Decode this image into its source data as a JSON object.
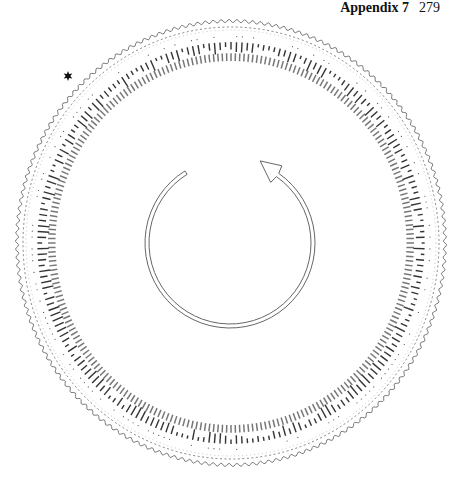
{
  "header": {
    "title": "Appendix 7",
    "page_number": "279"
  },
  "diagram": {
    "type": "circular-chronology-wheel",
    "marker": {
      "shape": "star",
      "angle_deg": 227
    },
    "outer_border": "wavy",
    "rings": [
      "wavy-outer-border",
      "dashed-ring",
      "name-labels-ring",
      "year-labels-ring"
    ],
    "visible_name_labels_left": [
      "Bu",
      "Chuan",
      "Ou",
      "Mohol",
      "Lamar",
      "Marrs",
      "Corn",
      "Chowmah",
      "Karr",
      "Abbel",
      "Xu",
      "Ince",
      "Wilson",
      "Cyrnell",
      "Zamel",
      "Cong",
      "Cla",
      "Rell"
    ],
    "visible_year_labels_left": [
      "2004",
      "2002",
      "2001",
      "2000",
      "1999",
      "1998",
      "1997",
      "1996",
      "1995",
      "1994",
      "1993",
      "1992",
      "1991",
      "1990",
      "1989",
      "1988",
      "1987",
      "1986"
    ],
    "center_arrow": {
      "direction": "clockwise",
      "style": "outlined-arc-arrow"
    }
  }
}
